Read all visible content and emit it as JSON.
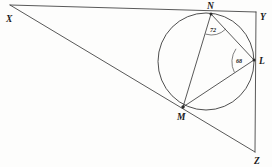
{
  "figure": {
    "background_color": "#fdfdfc",
    "ink_color": "#3b3b3b"
  },
  "points": {
    "X": {
      "label": "X",
      "x": 10,
      "y": 5,
      "label_x": 6,
      "label_y": 22
    },
    "Y": {
      "label": "Y",
      "x": 256,
      "y": 12,
      "label_x": 260,
      "label_y": 20
    },
    "Z": {
      "label": "Z",
      "x": 255,
      "y": 152,
      "label_x": 254,
      "label_y": 164
    },
    "N": {
      "label": "N",
      "x": 211,
      "y": 14,
      "label_x": 207,
      "label_y": 9
    },
    "L": {
      "label": "L",
      "x": 254,
      "y": 60,
      "label_x": 259,
      "label_y": 64
    },
    "M": {
      "label": "M",
      "x": 183,
      "y": 107,
      "label_x": 177,
      "label_y": 120
    }
  },
  "circle": {
    "name": "main-circle",
    "cx": 206,
    "cy": 61.5,
    "r": 48
  },
  "segments": [
    {
      "name": "segment-XY",
      "from": "X",
      "to": "Y"
    },
    {
      "name": "segment-XZ",
      "from": "X",
      "to": "Z"
    },
    {
      "name": "segment-YZ",
      "from": "Y",
      "to": "Z"
    },
    {
      "name": "chord-NM",
      "from": "N",
      "to": "M"
    },
    {
      "name": "chord-NL",
      "from": "N",
      "to": "L"
    },
    {
      "name": "chord-ML",
      "from": "M",
      "to": "L"
    }
  ],
  "angles": [
    {
      "name": "angle-at-N",
      "value": "72",
      "vertex": "N",
      "between": [
        "M",
        "L"
      ],
      "label_x": 210,
      "label_y": 32
    },
    {
      "name": "angle-at-L",
      "value": "68",
      "vertex": "L",
      "between": [
        "N",
        "M"
      ],
      "label_x": 236,
      "label_y": 63
    }
  ]
}
